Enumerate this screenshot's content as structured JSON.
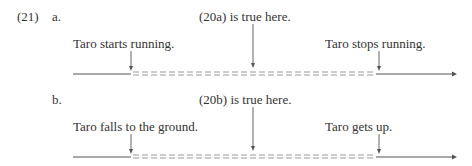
{
  "example_number": "(21)",
  "panels": [
    {
      "label": "a.",
      "header": "(20a) is true here.",
      "start_event": "Taro starts running.",
      "end_event": "Taro stops running.",
      "dashes": "= = = = = = = = = = = = = = = = = = = = = = = = = ="
    },
    {
      "label": "b.",
      "header": "(20b) is true here.",
      "start_event": "Taro falls to the ground.",
      "end_event": "Taro gets up.",
      "dashes": "= = = = = = = = = = = = = = = = = = = = = = = = = ="
    }
  ],
  "colors": {
    "text": "#333333",
    "line": "#555555",
    "dash": "#9a9a9a"
  }
}
